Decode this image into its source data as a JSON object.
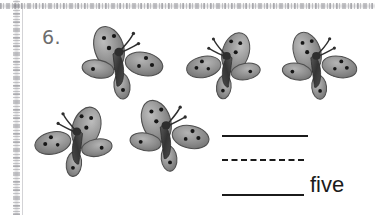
{
  "worksheet": {
    "problem_number": "6.",
    "item_kind": "butterfly",
    "item_count": 5,
    "answer_word": "five",
    "palette": {
      "wing_light": "#b0b0b0",
      "wing_mid": "#8d8d8d",
      "wing_dark": "#6e6e6e",
      "outline": "#4a4a4a",
      "spot": "#1a1a1a",
      "body": "#3c3c3c",
      "ink": "#1b1b1b",
      "number_gray": "#6d6d6d",
      "scan_edge": "#9a9a9f",
      "background": "#ffffff"
    },
    "butterflies": [
      {
        "id": "butterfly-1",
        "row": "top",
        "left": 78,
        "top": 24,
        "width": 92,
        "height": 78,
        "mirrored": false
      },
      {
        "id": "butterfly-2",
        "row": "top",
        "left": 180,
        "top": 30,
        "width": 84,
        "height": 72,
        "mirrored": true
      },
      {
        "id": "butterfly-3",
        "row": "top",
        "left": 278,
        "top": 30,
        "width": 86,
        "height": 72,
        "mirrored": false
      },
      {
        "id": "butterfly-4",
        "row": "bottom",
        "left": 28,
        "top": 104,
        "width": 88,
        "height": 76,
        "mirrored": true
      },
      {
        "id": "butterfly-5",
        "row": "bottom",
        "left": 126,
        "top": 96,
        "width": 90,
        "height": 80,
        "mirrored": false
      }
    ],
    "answer_lines": [
      {
        "id": "answer-line-1",
        "style": "solid",
        "left": 222,
        "top": 135,
        "width": 86,
        "label": ""
      },
      {
        "id": "answer-line-2",
        "style": "dashed",
        "left": 222,
        "top": 159,
        "width": 82,
        "label": ""
      },
      {
        "id": "answer-line-3",
        "style": "solid",
        "left": 222,
        "top": 194,
        "width": 82,
        "label": "five"
      }
    ]
  }
}
